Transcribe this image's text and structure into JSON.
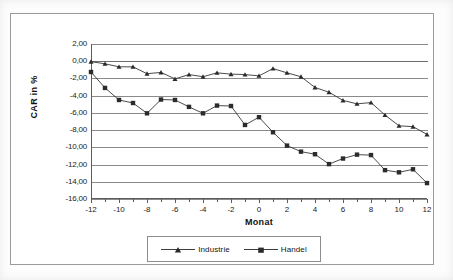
{
  "chart_data": {
    "type": "line",
    "title": "",
    "xlabel": "Monat",
    "ylabel": "CAR in %",
    "xlim": [
      -12,
      12
    ],
    "ylim": [
      -16,
      2
    ],
    "grid": true,
    "legend_position": "bottom-center",
    "decimal_separator": ",",
    "x_tick_labels": [
      "-12",
      "-10",
      "-8",
      "-6",
      "-4",
      "-2",
      "0",
      "2",
      "4",
      "6",
      "8",
      "10",
      "12"
    ],
    "x_tick_values": [
      -12,
      -10,
      -8,
      -6,
      -4,
      -2,
      0,
      2,
      4,
      6,
      8,
      10,
      12
    ],
    "x_minor_tick_values": [
      -11,
      -9,
      -7,
      -5,
      -3,
      -1,
      1,
      3,
      5,
      7,
      9,
      11
    ],
    "y_tick_labels": [
      "2,00",
      "0,00",
      "-2,00",
      "-4,00",
      "-6,00",
      "-8,00",
      "-10,00",
      "-12,00",
      "-14,00",
      "-16,00"
    ],
    "y_tick_values": [
      2,
      0,
      -2,
      -4,
      -6,
      -8,
      -10,
      -12,
      -14,
      -16
    ],
    "x": [
      -12,
      -11,
      -10,
      -9,
      -8,
      -7,
      -6,
      -5,
      -4,
      -3,
      -2,
      -1,
      0,
      1,
      2,
      3,
      4,
      5,
      6,
      7,
      8,
      9,
      10,
      11,
      12
    ],
    "series": [
      {
        "name": "Industrie",
        "marker": "triangle",
        "color": "#2b2b2b",
        "values": [
          -0.05,
          -0.3,
          -0.65,
          -0.65,
          -1.45,
          -1.3,
          -2.05,
          -1.55,
          -1.8,
          -1.35,
          -1.5,
          -1.55,
          -1.7,
          -0.85,
          -1.35,
          -1.8,
          -3.05,
          -3.6,
          -4.55,
          -4.95,
          -4.8,
          -6.25,
          -7.5,
          -7.6,
          -8.5
        ]
      },
      {
        "name": "Handel",
        "marker": "square",
        "color": "#2b2b2b",
        "values": [
          -1.25,
          -3.1,
          -4.5,
          -4.85,
          -6.05,
          -4.45,
          -4.5,
          -5.3,
          -6.05,
          -5.15,
          -5.2,
          -7.4,
          -6.5,
          -8.25,
          -9.8,
          -10.5,
          -10.8,
          -11.95,
          -11.3,
          -10.85,
          -10.9,
          -12.65,
          -12.9,
          -12.55,
          -14.15
        ]
      }
    ]
  },
  "legend": {
    "entries": [
      {
        "label": "Industrie",
        "marker": "triangle-marker"
      },
      {
        "label": "Handel",
        "marker": "square-marker"
      }
    ]
  }
}
